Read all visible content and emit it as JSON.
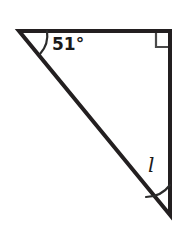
{
  "figure": {
    "type": "geometry-diagram",
    "shape": "right-triangle",
    "background_color": "#ffffff",
    "stroke_color": "#231f20",
    "stroke_width": 4,
    "marker_stroke_width": 2,
    "vertices": {
      "top_left": {
        "x": 19,
        "y": 31
      },
      "top_right": {
        "x": 170,
        "y": 31
      },
      "bottom_right": {
        "x": 170,
        "y": 215
      }
    },
    "sides": [
      {
        "name": "top-side",
        "from": "top_left",
        "to": "top_right"
      },
      {
        "name": "right-side",
        "from": "top_right",
        "to": "bottom_right"
      },
      {
        "name": "hypotenuse",
        "from": "top_left",
        "to": "bottom_right"
      }
    ],
    "angles": [
      {
        "name": "top-left-angle",
        "vertex": "top_left",
        "label": "51°",
        "marker": "arc",
        "arc_radius": 28
      },
      {
        "name": "top-right-angle",
        "vertex": "top_right",
        "label": "",
        "marker": "right-angle-square",
        "square_size": 14
      },
      {
        "name": "bottom-right-angle",
        "vertex": "bottom_right",
        "label": "l",
        "marker": "arc",
        "arc_radius": 30
      }
    ]
  },
  "labels": {
    "angle_top_left": "51°",
    "angle_bottom_right": "l"
  }
}
